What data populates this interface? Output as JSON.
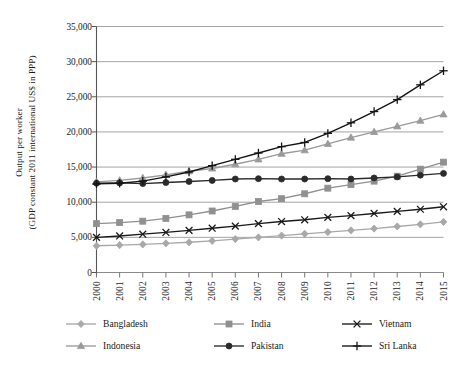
{
  "chart_data": {
    "type": "line",
    "title": "",
    "xlabel": "",
    "ylabel_line1": "Output per worker",
    "ylabel_line2": "(GDP constant 2011 international US$ in PPP)",
    "categories": [
      "2000",
      "2001",
      "2002",
      "2003",
      "2004",
      "2005",
      "2006",
      "2007",
      "2008",
      "2009",
      "2010",
      "2011",
      "2012",
      "2013",
      "2014",
      "2015"
    ],
    "ylim": [
      0,
      35000
    ],
    "yticks": [
      0,
      5000,
      10000,
      15000,
      20000,
      25000,
      30000,
      35000
    ],
    "ytick_labels": [
      "0",
      "5,000",
      "10,000",
      "15,000",
      "20,000",
      "25,000",
      "30,000",
      "35,000"
    ],
    "grid": true,
    "legend_position": "bottom",
    "series": [
      {
        "name": "Bangladesh",
        "color": "#a8a8a8",
        "marker": "diamond",
        "values": [
          3800,
          3900,
          4000,
          4150,
          4300,
          4500,
          4750,
          5000,
          5250,
          5500,
          5750,
          6000,
          6250,
          6550,
          6850,
          7200
        ]
      },
      {
        "name": "India",
        "color": "#909090",
        "marker": "square",
        "values": [
          6950,
          7100,
          7300,
          7700,
          8200,
          8750,
          9400,
          10100,
          10500,
          11200,
          12000,
          12500,
          13000,
          13700,
          14700,
          15700
        ]
      },
      {
        "name": "Vietnam",
        "color": "#1a1a1a",
        "marker": "cross",
        "values": [
          5000,
          5200,
          5450,
          5700,
          6000,
          6300,
          6600,
          6950,
          7250,
          7500,
          7850,
          8100,
          8400,
          8700,
          9000,
          9350
        ]
      },
      {
        "name": "Indonesia",
        "color": "#9a9a9a",
        "marker": "triangle",
        "values": [
          12900,
          13100,
          13450,
          13900,
          14400,
          14800,
          15400,
          16100,
          16900,
          17400,
          18300,
          19200,
          20000,
          20800,
          21600,
          22500
        ]
      },
      {
        "name": "Pakistan",
        "color": "#2b2b2b",
        "marker": "circle",
        "values": [
          12700,
          12750,
          12650,
          12800,
          12950,
          13100,
          13300,
          13350,
          13300,
          13300,
          13350,
          13300,
          13450,
          13600,
          13850,
          14100
        ]
      },
      {
        "name": "Sri Lanka",
        "color": "#141414",
        "marker": "plus",
        "values": [
          12600,
          12700,
          13000,
          13600,
          14300,
          15200,
          16100,
          17000,
          17900,
          18500,
          19800,
          21300,
          22900,
          24600,
          26700,
          28700
        ]
      }
    ]
  }
}
